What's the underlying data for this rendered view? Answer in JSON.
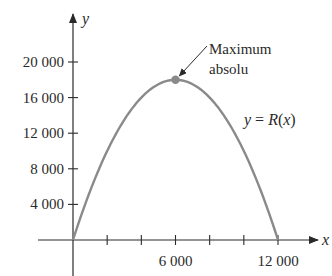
{
  "chart_data": {
    "type": "line",
    "title": "",
    "xlabel": "x",
    "ylabel": "y",
    "x_ticks": [
      0,
      2000,
      4000,
      6000,
      8000,
      10000,
      12000
    ],
    "x_tick_labels": [
      "6 000",
      "12 000"
    ],
    "x_tick_label_values": [
      6000,
      12000
    ],
    "y_ticks": [
      4000,
      8000,
      12000,
      16000,
      20000
    ],
    "y_tick_labels": [
      "4 000",
      "8 000",
      "12 000",
      "16 000",
      "20 000"
    ],
    "xlim": [
      0,
      12500
    ],
    "ylim": [
      0,
      23000
    ],
    "grid": false,
    "legend": null,
    "series": [
      {
        "name": "y = R(x)",
        "color": "#8a8a8a",
        "x": [
          0,
          1000,
          2000,
          3000,
          4000,
          5000,
          6000,
          7000,
          8000,
          9000,
          10000,
          11000,
          12000
        ],
        "values": [
          0,
          5500,
          10000,
          13500,
          16000,
          17500,
          18000,
          17500,
          16000,
          13500,
          10000,
          5500,
          0
        ]
      }
    ],
    "annotations": [
      {
        "text_line1": "Maximum",
        "text_line2": "absolu",
        "x": 6000,
        "y": 18000,
        "marker_color": "#8a8a8a"
      }
    ],
    "curve_label": {
      "prefix": "y = ",
      "fn": "R",
      "arg": "(x)"
    }
  }
}
